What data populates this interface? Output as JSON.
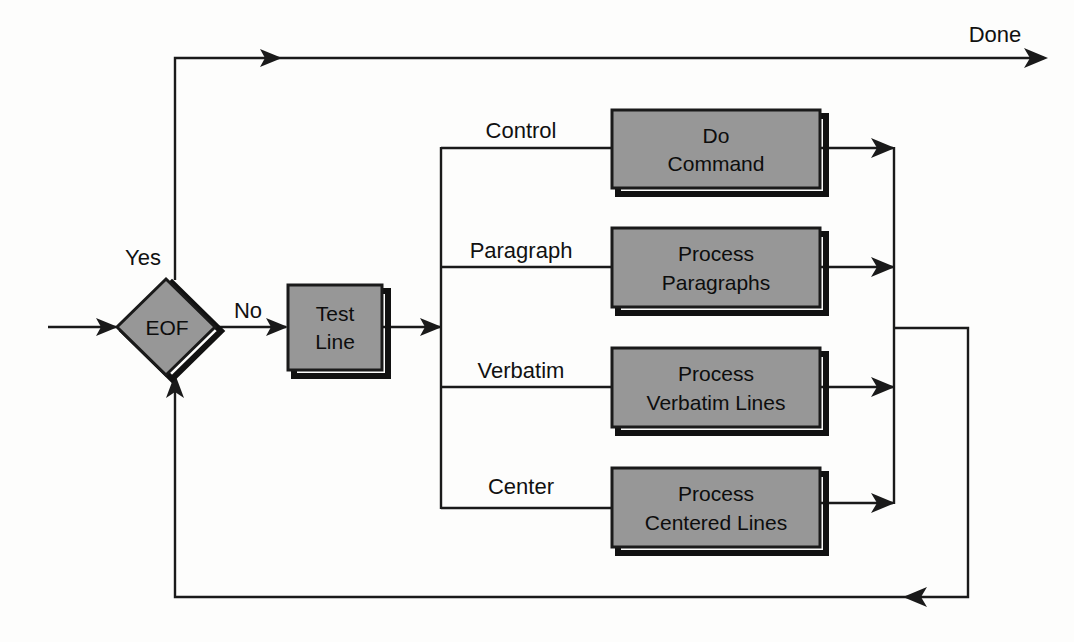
{
  "diagram": {
    "type": "flowchart",
    "colors": {
      "node_fill": "#979797",
      "node_border": "#1a1a1a",
      "connector": "#1a1a1a",
      "background": "#fdfdfc"
    },
    "nodes": [
      {
        "id": "eof",
        "shape": "diamond",
        "label": "EOF",
        "x": 165,
        "y": 327
      },
      {
        "id": "test-line",
        "shape": "rect",
        "label_line1": "Test",
        "label_line2": "Line",
        "x": 288,
        "y": 285,
        "w": 94,
        "h": 85
      },
      {
        "id": "do-command",
        "shape": "rect",
        "label_line1": "Do",
        "label_line2": "Command",
        "x": 612,
        "y": 110,
        "w": 208,
        "h": 78
      },
      {
        "id": "process-paragraphs",
        "shape": "rect",
        "label_line1": "Process",
        "label_line2": "Paragraphs",
        "x": 612,
        "y": 228,
        "w": 208,
        "h": 79
      },
      {
        "id": "process-verbatim",
        "shape": "rect",
        "label_line1": "Process",
        "label_line2": "Verbatim Lines",
        "x": 612,
        "y": 348,
        "w": 208,
        "h": 79
      },
      {
        "id": "process-centered",
        "shape": "rect",
        "label_line1": "Process",
        "label_line2": "Centered Lines",
        "x": 612,
        "y": 468,
        "w": 208,
        "h": 79
      }
    ],
    "edge_labels": [
      {
        "id": "yes",
        "text": "Yes",
        "x": 143,
        "y": 265
      },
      {
        "id": "no",
        "text": "No",
        "x": 248,
        "y": 318
      },
      {
        "id": "done",
        "text": "Done",
        "x": 995,
        "y": 42
      },
      {
        "id": "control",
        "text": "Control",
        "x": 521,
        "y": 138
      },
      {
        "id": "paragraph",
        "text": "Paragraph",
        "x": 521,
        "y": 258
      },
      {
        "id": "verbatim",
        "text": "Verbatim",
        "x": 521,
        "y": 378
      },
      {
        "id": "center",
        "text": "Center",
        "x": 521,
        "y": 494
      }
    ],
    "branches": [
      {
        "label": "Control",
        "target": "do-command"
      },
      {
        "label": "Paragraph",
        "target": "process-paragraphs"
      },
      {
        "label": "Verbatim",
        "target": "process-verbatim"
      },
      {
        "label": "Center",
        "target": "process-centered"
      }
    ]
  }
}
